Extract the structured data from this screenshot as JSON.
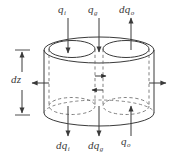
{
  "figure": {
    "type": "technical-diagram",
    "background_color": "#ffffff",
    "line_color": "#3a3a3a",
    "dashed_color": "#6a6a6a"
  },
  "labels": {
    "top": [
      {
        "id": "qi",
        "base": "q",
        "sub": "i",
        "x": 58,
        "y": 4
      },
      {
        "id": "qg",
        "base": "q",
        "sub": "g",
        "x": 88,
        "y": 4
      },
      {
        "id": "dqo",
        "base": "dq",
        "sub": "o",
        "x": 119,
        "y": 4
      }
    ],
    "left": [
      {
        "id": "dz",
        "base": "dz",
        "sub": "",
        "x": 11,
        "y": 74
      }
    ],
    "bottom": [
      {
        "id": "dqi",
        "base": "dq",
        "sub": "i",
        "x": 56,
        "y": 140
      },
      {
        "id": "dqg",
        "base": "dq",
        "sub": "g",
        "x": 88,
        "y": 140
      },
      {
        "id": "qo",
        "base": "q",
        "sub": "o",
        "x": 121,
        "y": 136
      }
    ]
  },
  "arrows": {
    "top_down_left": {
      "direction": "down",
      "label": "qi"
    },
    "top_down_center": {
      "direction": "down",
      "label": "qg"
    },
    "top_up_right": {
      "direction": "up",
      "label": "dqo"
    },
    "bottom_down_left": {
      "direction": "down",
      "label": "dqi"
    },
    "bottom_down_center": {
      "direction": "down",
      "label": "dqg"
    },
    "bottom_up_right": {
      "direction": "up",
      "label": "qo"
    },
    "side_left": {
      "direction": "left"
    },
    "side_right": {
      "direction": "right"
    },
    "mid_right": {
      "direction": "right"
    },
    "mid_left": {
      "direction": "left"
    },
    "dz_dimension": {
      "direction": "double-vertical"
    }
  },
  "geometry": {
    "outer_cylinder": {
      "cx": 99,
      "top_cy": 50,
      "bottom_cy": 113,
      "rx": 71,
      "ry": 13
    },
    "inner_cylinder_left": {
      "cx": 71,
      "top_cy": 49,
      "rx": 25,
      "ry": 9
    },
    "inner_cylinder_right": {
      "cx": 128,
      "top_cy": 49,
      "rx": 25,
      "ry": 9
    }
  }
}
